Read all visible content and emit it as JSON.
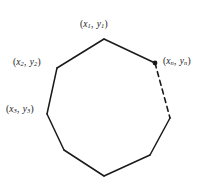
{
  "figure": {
    "kind": "polygon-vertex-diagram",
    "background_color": "#ffffff",
    "stroke_color": "#1a1a1a",
    "labels": [
      {
        "id": "label-1",
        "open": "(",
        "x_var": "x",
        "x_sub": "1",
        "comma": ", ",
        "y_var": "y",
        "y_sub": "1",
        "close": ")"
      },
      {
        "id": "label-2",
        "open": "(",
        "x_var": "x",
        "x_sub": "2",
        "comma": ", ",
        "y_var": "y",
        "y_sub": "2",
        "close": ")"
      },
      {
        "id": "label-3",
        "open": "(",
        "x_var": "x",
        "x_sub": "3",
        "comma": ", ",
        "y_var": "y",
        "y_sub": "3",
        "close": ")"
      },
      {
        "id": "label-n",
        "open": "(",
        "x_var": "x",
        "x_sub": "n",
        "comma": ", ",
        "y_var": "y",
        "y_sub": "n",
        "close": ")"
      }
    ]
  },
  "chart_data": {
    "type": "scatter",
    "title": "",
    "xlabel": "",
    "ylabel": "",
    "vertices": [
      {
        "label": "(x1, y1)",
        "x": 104,
        "y": 39,
        "marker": "none",
        "labeled": true
      },
      {
        "label": "(xn, yn)",
        "x": 155,
        "y": 63,
        "marker": "filled",
        "labeled": true
      },
      {
        "label": "",
        "x": 170,
        "y": 118,
        "marker": "none",
        "labeled": false
      },
      {
        "label": "",
        "x": 150,
        "y": 155,
        "marker": "none",
        "labeled": false
      },
      {
        "label": "",
        "x": 104,
        "y": 176,
        "marker": "none",
        "labeled": false
      },
      {
        "label": "",
        "x": 64,
        "y": 150,
        "marker": "none",
        "labeled": false
      },
      {
        "label": "(x3, y3)",
        "x": 47,
        "y": 114,
        "marker": "none",
        "labeled": true
      },
      {
        "label": "(x2, y2)",
        "x": 57,
        "y": 68,
        "marker": "none",
        "labeled": true
      }
    ],
    "edges": [
      {
        "from": 0,
        "to": 1,
        "style": "solid"
      },
      {
        "from": 1,
        "to": 2,
        "style": "dashed"
      },
      {
        "from": 2,
        "to": 3,
        "style": "solid"
      },
      {
        "from": 3,
        "to": 4,
        "style": "solid"
      },
      {
        "from": 4,
        "to": 5,
        "style": "solid"
      },
      {
        "from": 5,
        "to": 6,
        "style": "solid"
      },
      {
        "from": 6,
        "to": 7,
        "style": "solid"
      },
      {
        "from": 7,
        "to": 0,
        "style": "solid"
      }
    ],
    "xlim": [
      0,
      204
    ],
    "ylim": [
      0,
      184
    ],
    "grid": false,
    "legend": null
  }
}
